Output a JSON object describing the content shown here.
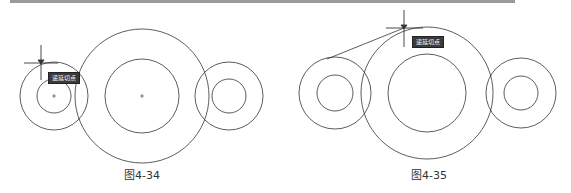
{
  "figures": [
    {
      "id": "left",
      "caption": "图4-34",
      "tooltip": "递延切点",
      "cursor_suffix": "...",
      "circles": [
        {
          "cx": 54,
          "cy": 96,
          "r": 34
        },
        {
          "cx": 54,
          "cy": 96,
          "r": 17
        },
        {
          "cx": 142,
          "cy": 96,
          "r": 67
        },
        {
          "cx": 142,
          "cy": 96,
          "r": 37
        },
        {
          "cx": 229,
          "cy": 96,
          "r": 34
        },
        {
          "cx": 229,
          "cy": 96,
          "r": 17
        }
      ]
    },
    {
      "id": "right",
      "caption": "图4-35",
      "tooltip": "递延切点",
      "cursor_suffix": "...",
      "circles": [
        {
          "cx": 50,
          "cy": 93,
          "r": 36
        },
        {
          "cx": 50,
          "cy": 93,
          "r": 18
        },
        {
          "cx": 142,
          "cy": 93,
          "r": 66
        },
        {
          "cx": 142,
          "cy": 93,
          "r": 39
        },
        {
          "cx": 236,
          "cy": 93,
          "r": 35
        },
        {
          "cx": 236,
          "cy": 93,
          "r": 17
        }
      ]
    }
  ],
  "colors": {
    "line": "#333333",
    "tooltip_bg": "#3a3a3a",
    "tooltip_text": "#ffffff"
  }
}
